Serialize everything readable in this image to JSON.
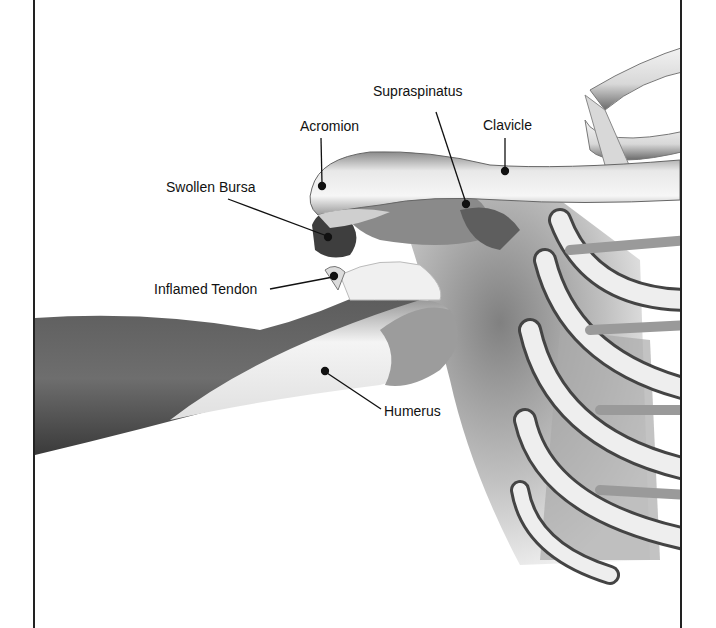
{
  "diagram": {
    "labels": [
      {
        "id": "supraspinatus",
        "text": "Supraspinatus",
        "x": 373,
        "y": 83,
        "pointer": [
          [
            436,
            112
          ],
          [
            466,
            203
          ]
        ]
      },
      {
        "id": "acromion",
        "text": "Acromion",
        "x": 300,
        "y": 118,
        "pointer": [
          [
            321,
            138
          ],
          [
            322,
            185
          ]
        ]
      },
      {
        "id": "clavicle",
        "text": "Clavicle",
        "x": 483,
        "y": 117,
        "pointer": [
          [
            505,
            138
          ],
          [
            505,
            171
          ]
        ]
      },
      {
        "id": "swollen-bursa",
        "text": "Swollen Bursa",
        "x": 166,
        "y": 179,
        "pointer": [
          [
            228,
            199
          ],
          [
            328,
            237
          ]
        ]
      },
      {
        "id": "inflamed-tendon",
        "text": "Inflamed Tendon",
        "x": 154,
        "y": 281,
        "pointer": [
          [
            270,
            289
          ],
          [
            334,
            276
          ]
        ]
      },
      {
        "id": "humerus",
        "text": "Humerus",
        "x": 384,
        "y": 403,
        "pointer": [
          [
            325,
            371
          ],
          [
            381,
            409
          ]
        ]
      }
    ],
    "colors": {
      "line": "#111111",
      "frame": "#222222",
      "bone_light": "#f2f2f2",
      "bone_shadow": "#8a8a8a",
      "muscle_dark": "#555555"
    }
  }
}
